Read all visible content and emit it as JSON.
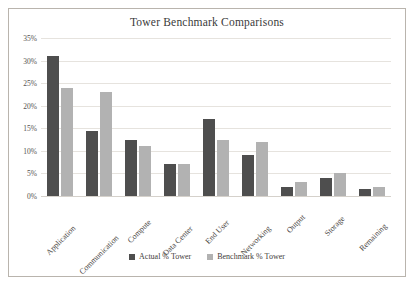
{
  "chart_data": {
    "type": "bar",
    "title": "Tower Benchmark Comparisons",
    "xlabel": "",
    "ylabel": "",
    "ylim": [
      0,
      35
    ],
    "ytick_values": [
      35,
      30,
      25,
      20,
      15,
      10,
      5,
      0
    ],
    "ytick_labels": [
      "35%",
      "30%",
      "25%",
      "20%",
      "15%",
      "10%",
      "5%",
      "0%"
    ],
    "grid": true,
    "legend_position": "bottom",
    "categories": [
      "Application",
      "Communication",
      "Compute",
      "Data Center",
      "End User",
      "Networking",
      "Output",
      "Storage",
      "Remaining"
    ],
    "series": [
      {
        "name": "Actual % Tower",
        "color": "#4e4e4e",
        "values": [
          31,
          14.5,
          12.5,
          7,
          17,
          9,
          2,
          4,
          1.5
        ]
      },
      {
        "name": "Benchmark % Tower",
        "color": "#b2b2b2",
        "values": [
          24,
          23,
          11,
          7,
          12.5,
          12,
          3,
          5,
          2
        ]
      }
    ]
  }
}
